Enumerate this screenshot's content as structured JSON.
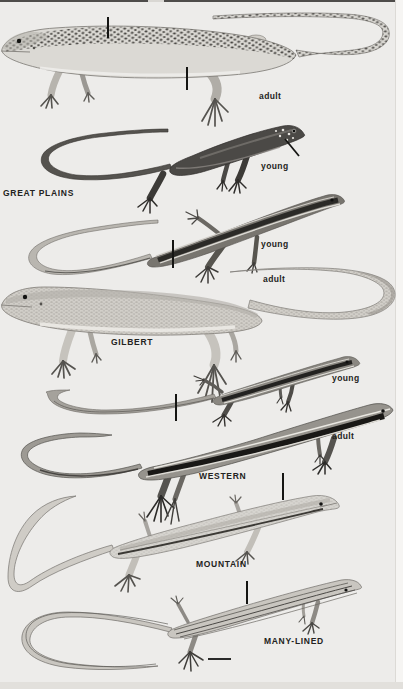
{
  "plate": {
    "background": "#edecea",
    "label_color": "#232321",
    "artwork_style": "grayscale halftone illustration",
    "groups": [
      {
        "id": "great-plains",
        "species_label": "GREAT PLAINS",
        "stage_labels": {
          "adult": "adult",
          "young": "young"
        }
      },
      {
        "id": "gilbert",
        "species_label": "GILBERT",
        "stage_labels": {
          "young": "young",
          "adult": "adult"
        }
      },
      {
        "id": "western",
        "species_label": "WESTERN",
        "stage_labels": {
          "young": "young",
          "adult": "adult"
        }
      },
      {
        "id": "mountain",
        "species_label": "MOUNTAIN",
        "stage_labels": {}
      },
      {
        "id": "many-lined",
        "species_label": "MANY-LINED",
        "stage_labels": {}
      }
    ]
  }
}
